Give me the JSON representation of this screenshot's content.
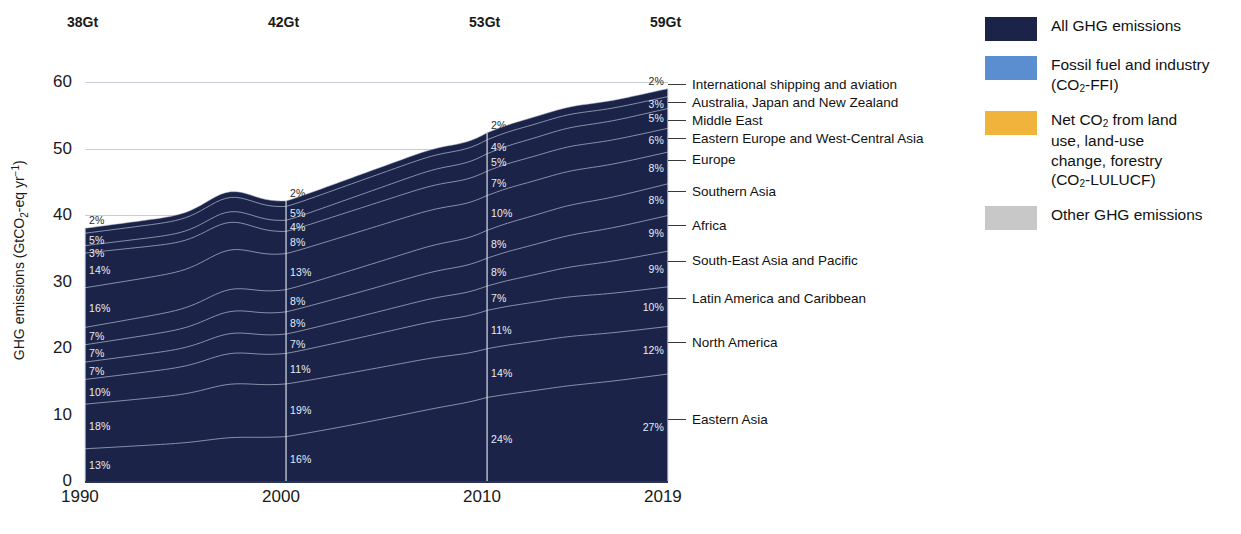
{
  "figure": {
    "title_fragment": "",
    "y_axis_label": "GHG emissions (GtCO2-eq yr-1)",
    "y_axis_label_parts": {
      "prefix": "GHG emissions (GtCO",
      "sub": "2",
      "mid": "-eq yr",
      "sup": "−1",
      "suffix": ")"
    }
  },
  "chart_data": {
    "type": "area",
    "xlabel": "",
    "ylabel": "GHG emissions (GtCO2-eq yr-1)",
    "ylim": [
      0,
      62
    ],
    "xlim": [
      1990,
      2019
    ],
    "grid": true,
    "legend_position": "right",
    "x_tick_labels": [
      "1990",
      "2000",
      "2010",
      "2019"
    ],
    "x_tick_years": [
      1990,
      2000,
      2010,
      2019
    ],
    "y_tick_labels": [
      "0",
      "10",
      "20",
      "30",
      "40",
      "50",
      "60"
    ],
    "y_tick_values": [
      0,
      10,
      20,
      30,
      40,
      50,
      60
    ],
    "top_totals": [
      {
        "year": 1990,
        "label": "38Gt",
        "value": 38
      },
      {
        "year": 2000,
        "label": "42Gt",
        "value": 42
      },
      {
        "year": 2010,
        "label": "53Gt",
        "value": 53
      },
      {
        "year": 2019,
        "label": "59Gt",
        "value": 59
      }
    ],
    "stack_order_bottom_to_top": [
      "Eastern Asia",
      "North America",
      "Latin America and Caribbean",
      "South-East Asia and Pacific",
      "Africa",
      "Southern Asia",
      "Europe",
      "Eastern Europe and West-Central Asia",
      "Middle East",
      "Australia, Japan and New Zealand",
      "International shipping and aviation"
    ],
    "series": [
      {
        "name": "Eastern Asia",
        "shares_pct": {
          "1990": 13,
          "2000": 16,
          "2010": 24,
          "2019": 27
        },
        "values_gt": {
          "1990": 4.9,
          "2000": 6.7,
          "2010": 12.7,
          "2019": 15.9
        }
      },
      {
        "name": "North America",
        "shares_pct": {
          "1990": 18,
          "2000": 19,
          "2010": 14,
          "2019": 12
        },
        "values_gt": {
          "1990": 6.8,
          "2000": 8.0,
          "2010": 7.4,
          "2019": 7.1
        }
      },
      {
        "name": "Latin America and Caribbean",
        "shares_pct": {
          "1990": 10,
          "2000": 11,
          "2010": 11,
          "2019": 10
        },
        "values_gt": {
          "1990": 3.8,
          "2000": 4.6,
          "2010": 5.8,
          "2019": 5.9
        }
      },
      {
        "name": "South-East Asia and Pacific",
        "shares_pct": {
          "1990": 7,
          "2000": 7,
          "2010": 7,
          "2019": 9
        },
        "values_gt": {
          "1990": 2.7,
          "2000": 2.9,
          "2010": 3.7,
          "2019": 5.3
        }
      },
      {
        "name": "Africa",
        "shares_pct": {
          "1990": 7,
          "2000": 8,
          "2010": 8,
          "2019": 9
        },
        "values_gt": {
          "1990": 2.7,
          "2000": 3.4,
          "2010": 4.2,
          "2019": 5.3
        }
      },
      {
        "name": "Southern Asia",
        "shares_pct": {
          "1990": 7,
          "2000": 8,
          "2010": 8,
          "2019": 8
        },
        "values_gt": {
          "1990": 2.7,
          "2000": 3.4,
          "2010": 4.2,
          "2019": 4.7
        }
      },
      {
        "name": "Europe",
        "shares_pct": {
          "1990": 16,
          "2000": 13,
          "2010": 10,
          "2019": 8
        },
        "values_gt": {
          "1990": 6.1,
          "2000": 5.5,
          "2010": 5.3,
          "2019": 4.7
        }
      },
      {
        "name": "Eastern Europe and West-Central Asia",
        "shares_pct": {
          "1990": 14,
          "2000": 8,
          "2010": 7,
          "2019": 6
        },
        "values_gt": {
          "1990": 5.3,
          "2000": 3.4,
          "2010": 3.7,
          "2019": 3.5
        }
      },
      {
        "name": "Middle East",
        "shares_pct": {
          "1990": 3,
          "2000": 4,
          "2010": 5,
          "2019": 5
        },
        "values_gt": {
          "1990": 1.1,
          "2000": 1.7,
          "2010": 2.7,
          "2019": 3.0
        }
      },
      {
        "name": "Australia, Japan and New Zealand",
        "shares_pct": {
          "1990": 5,
          "2000": 5,
          "2010": 4,
          "2019": 3
        },
        "values_gt": {
          "1990": 1.9,
          "2000": 2.1,
          "2010": 2.1,
          "2019": 1.8
        }
      },
      {
        "name": "International shipping and aviation",
        "shares_pct": {
          "1990": 2,
          "2000": 2,
          "2010": 2,
          "2019": 2
        },
        "values_gt": {
          "1990": 0.8,
          "2000": 0.8,
          "2010": 1.1,
          "2019": 1.2
        }
      }
    ]
  },
  "column_labels": {
    "1990": [
      "2%",
      "5%",
      "3%",
      "14%",
      "16%",
      "7%",
      "7%",
      "7%",
      "10%",
      "18%",
      "13%"
    ],
    "2000": [
      "2%",
      "5%",
      "4%",
      "8%",
      "13%",
      "8%",
      "8%",
      "7%",
      "11%",
      "19%",
      "16%"
    ],
    "2010": [
      "2%",
      "4%",
      "5%",
      "7%",
      "10%",
      "8%",
      "8%",
      "7%",
      "11%",
      "14%",
      "24%"
    ],
    "2019": [
      "2%",
      "3%",
      "5%",
      "6%",
      "8%",
      "8%",
      "9%",
      "9%",
      "10%",
      "12%",
      "27%"
    ]
  },
  "region_callouts": [
    "International shipping and aviation",
    "Australia, Japan and New Zealand",
    "Middle East",
    "Eastern Europe and West-Central Asia",
    "Europe",
    "Southern Asia",
    "Africa",
    "South-East Asia and Pacific",
    "Latin America and Caribbean",
    "North America",
    "Eastern Asia"
  ],
  "legend": {
    "items": [
      {
        "label": "All GHG emissions",
        "color": "#1b2448",
        "lines": [
          {
            "text": "All GHG emissions"
          }
        ]
      },
      {
        "label": "Fossil fuel and industry (CO2-FFI)",
        "color": "#5b8ed0",
        "lines": [
          {
            "text": "Fossil fuel and industry"
          },
          {
            "text": "(CO",
            "sub": "2",
            "after": "-FFI)"
          }
        ]
      },
      {
        "label": "Net CO2 from land use, land-use change, forestry (CO2-LULUCF)",
        "color": "#f0b43c",
        "lines": [
          {
            "text": "Net CO",
            "sub": "2",
            "after": " from land"
          },
          {
            "text": "use, land-use"
          },
          {
            "text": "change, forestry"
          },
          {
            "text": "(CO",
            "sub": "2",
            "after": "-LULUCF)"
          }
        ]
      },
      {
        "label": "Other GHG emissions",
        "color": "#c8c8c8",
        "lines": [
          {
            "text": "Other GHG emissions"
          }
        ]
      }
    ]
  },
  "colors": {
    "area_fill": "#1b2448",
    "boundary_line": "#aab3c9",
    "gridline": "#c9ccd6",
    "axis": "#2a3358",
    "label_text": "#e9ecf4",
    "page_bg": "#ffffff"
  }
}
